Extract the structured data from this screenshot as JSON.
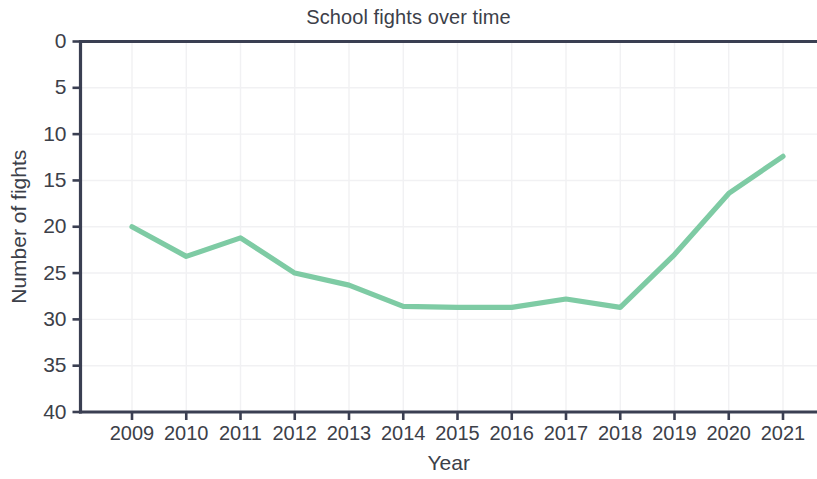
{
  "chart_data": {
    "type": "line",
    "title": "School fights over time",
    "xlabel": "Year",
    "ylabel": "Number of fights",
    "categories": [
      "2009",
      "2010",
      "2011",
      "2012",
      "2013",
      "2014",
      "2015",
      "2016",
      "2017",
      "2018",
      "2019",
      "2020",
      "2021"
    ],
    "x": [
      2009,
      2010,
      2011,
      2012,
      2013,
      2014,
      2015,
      2016,
      2017,
      2018,
      2019,
      2020,
      2021
    ],
    "values": [
      20.0,
      23.2,
      21.2,
      25.0,
      26.3,
      28.6,
      28.7,
      28.7,
      27.8,
      28.7,
      23.0,
      16.4,
      12.4
    ],
    "series": [
      {
        "name": "Number of fights",
        "values": [
          20.0,
          23.2,
          21.2,
          25.0,
          26.3,
          28.6,
          28.7,
          28.7,
          27.8,
          28.7,
          23.0,
          16.4,
          12.4
        ],
        "color": "#7ecba4"
      }
    ],
    "ylim": [
      0,
      40
    ],
    "y_inverted": true,
    "yticks": [
      0,
      5,
      10,
      15,
      20,
      25,
      30,
      35,
      40
    ],
    "ytick_labels": [
      "0",
      "5",
      "10",
      "15",
      "20",
      "25",
      "30",
      "35",
      "40"
    ],
    "xticks": [
      2009,
      2010,
      2011,
      2012,
      2013,
      2014,
      2015,
      2016,
      2017,
      2018,
      2019,
      2020,
      2021
    ],
    "xtick_labels": [
      "2009",
      "2010",
      "2011",
      "2012",
      "2013",
      "2014",
      "2015",
      "2016",
      "2017",
      "2018",
      "2019",
      "2020",
      "2021"
    ],
    "grid": true,
    "grid_color": "#f1f1f3",
    "legend": null,
    "legend_position": "none",
    "line_color": "#7ecba4",
    "axis_color": "#3a3f52",
    "text_color": "#3c4049",
    "background": "#ffffff"
  }
}
